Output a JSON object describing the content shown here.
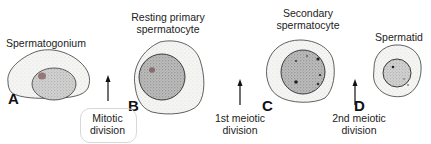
{
  "figure": {
    "stages": [
      {
        "letter": "A",
        "title": "Spermatogonium"
      },
      {
        "letter": "B",
        "title_line1": "Resting primary",
        "title_line2": "spermatocyte"
      },
      {
        "letter": "C",
        "title_line1": "Secondary",
        "title_line2": "spermatocyte"
      },
      {
        "letter": "D",
        "title": "Spermatid"
      }
    ],
    "transitions": [
      {
        "line1": "Mitotic",
        "line2": "division"
      },
      {
        "line1": "1st meiotic",
        "line2": "division"
      },
      {
        "line1": "2nd meiotic",
        "line2": "division"
      }
    ]
  },
  "colors": {
    "outline": "#3a3a3a",
    "cytoplasm": "#f4f4f2",
    "nucleus": "#cfcfcf",
    "nucleus_dark": "#a9a9a9",
    "chromatin": "#222222"
  }
}
